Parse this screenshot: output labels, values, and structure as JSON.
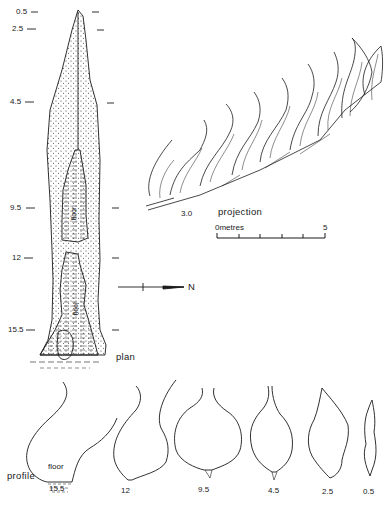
{
  "plan": {
    "title": "plan",
    "depth_markers": [
      {
        "label": "0.5",
        "y": 12
      },
      {
        "label": "2.5",
        "y": 60
      },
      {
        "label": "4.5",
        "y": 101
      },
      {
        "label": "9.5",
        "y": 208
      },
      {
        "label": "12",
        "y": 258
      },
      {
        "label": "15.5",
        "y": 329
      }
    ],
    "floor_labels": [
      "floor",
      "floor"
    ],
    "north_label": "N"
  },
  "projection": {
    "title": "projection",
    "start_label": "3.0"
  },
  "scale_bar": {
    "start_label": "0metres",
    "end_label": "5",
    "divisions": 5
  },
  "profiles": {
    "title": "profile",
    "floor_label": "floor",
    "sections": [
      {
        "label": "15.5"
      },
      {
        "label": "12"
      },
      {
        "label": "9.5"
      },
      {
        "label": "4.5"
      },
      {
        "label": "2.5"
      },
      {
        "label": "0.5"
      }
    ]
  },
  "colors": {
    "ink": "#1a1a1a",
    "background": "#ffffff"
  }
}
